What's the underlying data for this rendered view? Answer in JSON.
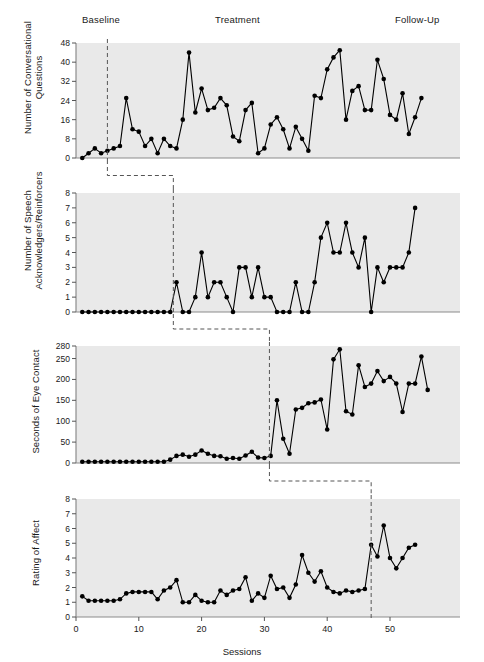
{
  "figure": {
    "phases": [
      {
        "name": "phase-baseline",
        "label": "Baseline",
        "x": 82,
        "y": 14
      },
      {
        "name": "phase-treatment",
        "label": "Treatment",
        "x": 215,
        "y": 14
      },
      {
        "name": "phase-follow-up",
        "label": "Follow-Up",
        "x": 395,
        "y": 14
      }
    ],
    "xlabel": "Sessions",
    "background": "#e9e9e9",
    "accent": "#000000"
  },
  "chart_data": [
    {
      "type": "line",
      "panel": 1,
      "title": "",
      "ylabel": "Number of Conversational Questions",
      "xlabel": "",
      "ylim": [
        0,
        48
      ],
      "yticks": [
        0,
        8,
        16,
        24,
        32,
        40,
        48
      ],
      "xlim": [
        0,
        58
      ],
      "grid": false,
      "phase_change_session": 5,
      "x": [
        1,
        2,
        3,
        4,
        5,
        6,
        7,
        8,
        9,
        10,
        11,
        12,
        13,
        14,
        15,
        16,
        17,
        18,
        19,
        20,
        21,
        22,
        23,
        24,
        25,
        26,
        27,
        28,
        29,
        30,
        31,
        32,
        33,
        34,
        35,
        36,
        37,
        38,
        39,
        40,
        41,
        42,
        43,
        44,
        45,
        46,
        47,
        48,
        49,
        50,
        51,
        52,
        53,
        54
      ],
      "values": [
        0,
        2,
        4,
        2,
        3,
        4,
        5,
        25,
        12,
        11,
        5,
        8,
        2,
        8,
        5,
        4,
        16,
        44,
        19,
        29,
        20,
        21,
        25,
        22,
        9,
        7,
        20,
        23,
        2,
        4,
        14,
        17,
        12,
        4,
        13,
        8,
        3,
        26,
        25,
        37,
        42,
        45,
        16,
        28,
        30,
        20,
        20,
        41,
        33,
        18,
        16,
        27,
        10,
        17,
        25
      ]
    },
    {
      "type": "line",
      "panel": 2,
      "title": "",
      "ylabel": "Number of Speech Acknowledgers/Reinforcers",
      "xlabel": "",
      "ylim": [
        0,
        8
      ],
      "yticks": [
        0,
        1,
        2,
        3,
        4,
        5,
        6,
        7,
        8
      ],
      "xlim": [
        0,
        58
      ],
      "grid": false,
      "phase_change_session": 15.5,
      "x": [
        1,
        2,
        3,
        4,
        5,
        6,
        7,
        8,
        9,
        10,
        11,
        12,
        13,
        14,
        15,
        16,
        17,
        18,
        19,
        20,
        21,
        22,
        23,
        24,
        25,
        26,
        27,
        28,
        29,
        30,
        31,
        32,
        33,
        34,
        35,
        36,
        37,
        38,
        39,
        40,
        41,
        42,
        43,
        44,
        45,
        46,
        47,
        48,
        49,
        50,
        51,
        52,
        53,
        54
      ],
      "values": [
        0,
        0,
        0,
        0,
        0,
        0,
        0,
        0,
        0,
        0,
        0,
        0,
        0,
        0,
        0,
        2,
        0,
        0,
        1,
        4,
        1,
        2,
        2,
        1,
        0,
        3,
        3,
        1,
        3,
        1,
        1,
        0,
        0,
        0,
        2,
        0,
        0,
        2,
        5,
        6,
        4,
        4,
        6,
        4,
        3,
        5,
        0,
        3,
        2,
        3,
        3,
        3,
        4,
        7
      ]
    },
    {
      "type": "line",
      "panel": 3,
      "title": "",
      "ylabel": "Seconds of Eye Contact",
      "xlabel": "",
      "ylim": [
        0,
        280
      ],
      "yticks": [
        0,
        50,
        100,
        150,
        200,
        250,
        280
      ],
      "xlim": [
        0,
        58
      ],
      "grid": false,
      "phase_change_session": 30.8,
      "x": [
        1,
        2,
        3,
        4,
        5,
        6,
        7,
        8,
        9,
        10,
        11,
        12,
        13,
        14,
        15,
        16,
        17,
        18,
        19,
        20,
        21,
        22,
        23,
        24,
        25,
        26,
        27,
        28,
        29,
        30,
        31,
        32,
        33,
        34,
        35,
        36,
        37,
        38,
        39,
        40,
        41,
        42,
        43,
        44,
        45,
        46,
        47,
        48,
        49,
        50,
        51,
        52,
        53
      ],
      "values": [
        3,
        3,
        3,
        3,
        3,
        3,
        3,
        3,
        3,
        3,
        3,
        3,
        3,
        3,
        8,
        17,
        20,
        15,
        20,
        30,
        22,
        17,
        16,
        10,
        12,
        10,
        18,
        27,
        13,
        12,
        17,
        150,
        58,
        22,
        128,
        132,
        143,
        145,
        152,
        80,
        248,
        272,
        124,
        116,
        234,
        182,
        190,
        220,
        196,
        206,
        190,
        122,
        190,
        190,
        255,
        175
      ]
    },
    {
      "type": "line",
      "panel": 4,
      "title": "",
      "ylabel": "Rating of Affect",
      "xlabel": "Sessions",
      "ylim": [
        0,
        8
      ],
      "yticks": [
        0,
        1,
        2,
        3,
        4,
        5,
        6,
        7,
        8
      ],
      "xlim": [
        0,
        58
      ],
      "xticks": [
        0,
        10,
        20,
        30,
        40,
        50
      ],
      "grid": false,
      "phase_change_session": 47,
      "x": [
        1,
        2,
        3,
        4,
        5,
        6,
        7,
        8,
        9,
        10,
        11,
        12,
        13,
        14,
        15,
        16,
        17,
        18,
        19,
        20,
        21,
        22,
        23,
        24,
        25,
        26,
        27,
        28,
        29,
        30,
        31,
        32,
        33,
        34,
        35,
        36,
        37,
        38,
        39,
        40,
        41,
        42,
        43,
        44,
        45,
        46,
        47,
        48,
        49,
        50,
        51,
        52,
        53,
        54
      ],
      "values": [
        1.4,
        1.1,
        1.1,
        1.1,
        1.1,
        1.1,
        1.2,
        1.6,
        1.7,
        1.7,
        1.7,
        1.7,
        1.2,
        1.8,
        2.0,
        2.5,
        1.0,
        1.0,
        1.5,
        1.1,
        1.0,
        1.0,
        1.8,
        1.5,
        1.8,
        1.9,
        2.7,
        1.1,
        1.6,
        1.3,
        2.8,
        1.9,
        2.0,
        1.3,
        2.2,
        4.2,
        3.0,
        2.4,
        3.1,
        2.0,
        1.7,
        1.6,
        1.8,
        1.7,
        1.8,
        1.9,
        4.9,
        4.1,
        6.2,
        4.0,
        3.3,
        4.0,
        4.7,
        4.9
      ]
    }
  ]
}
